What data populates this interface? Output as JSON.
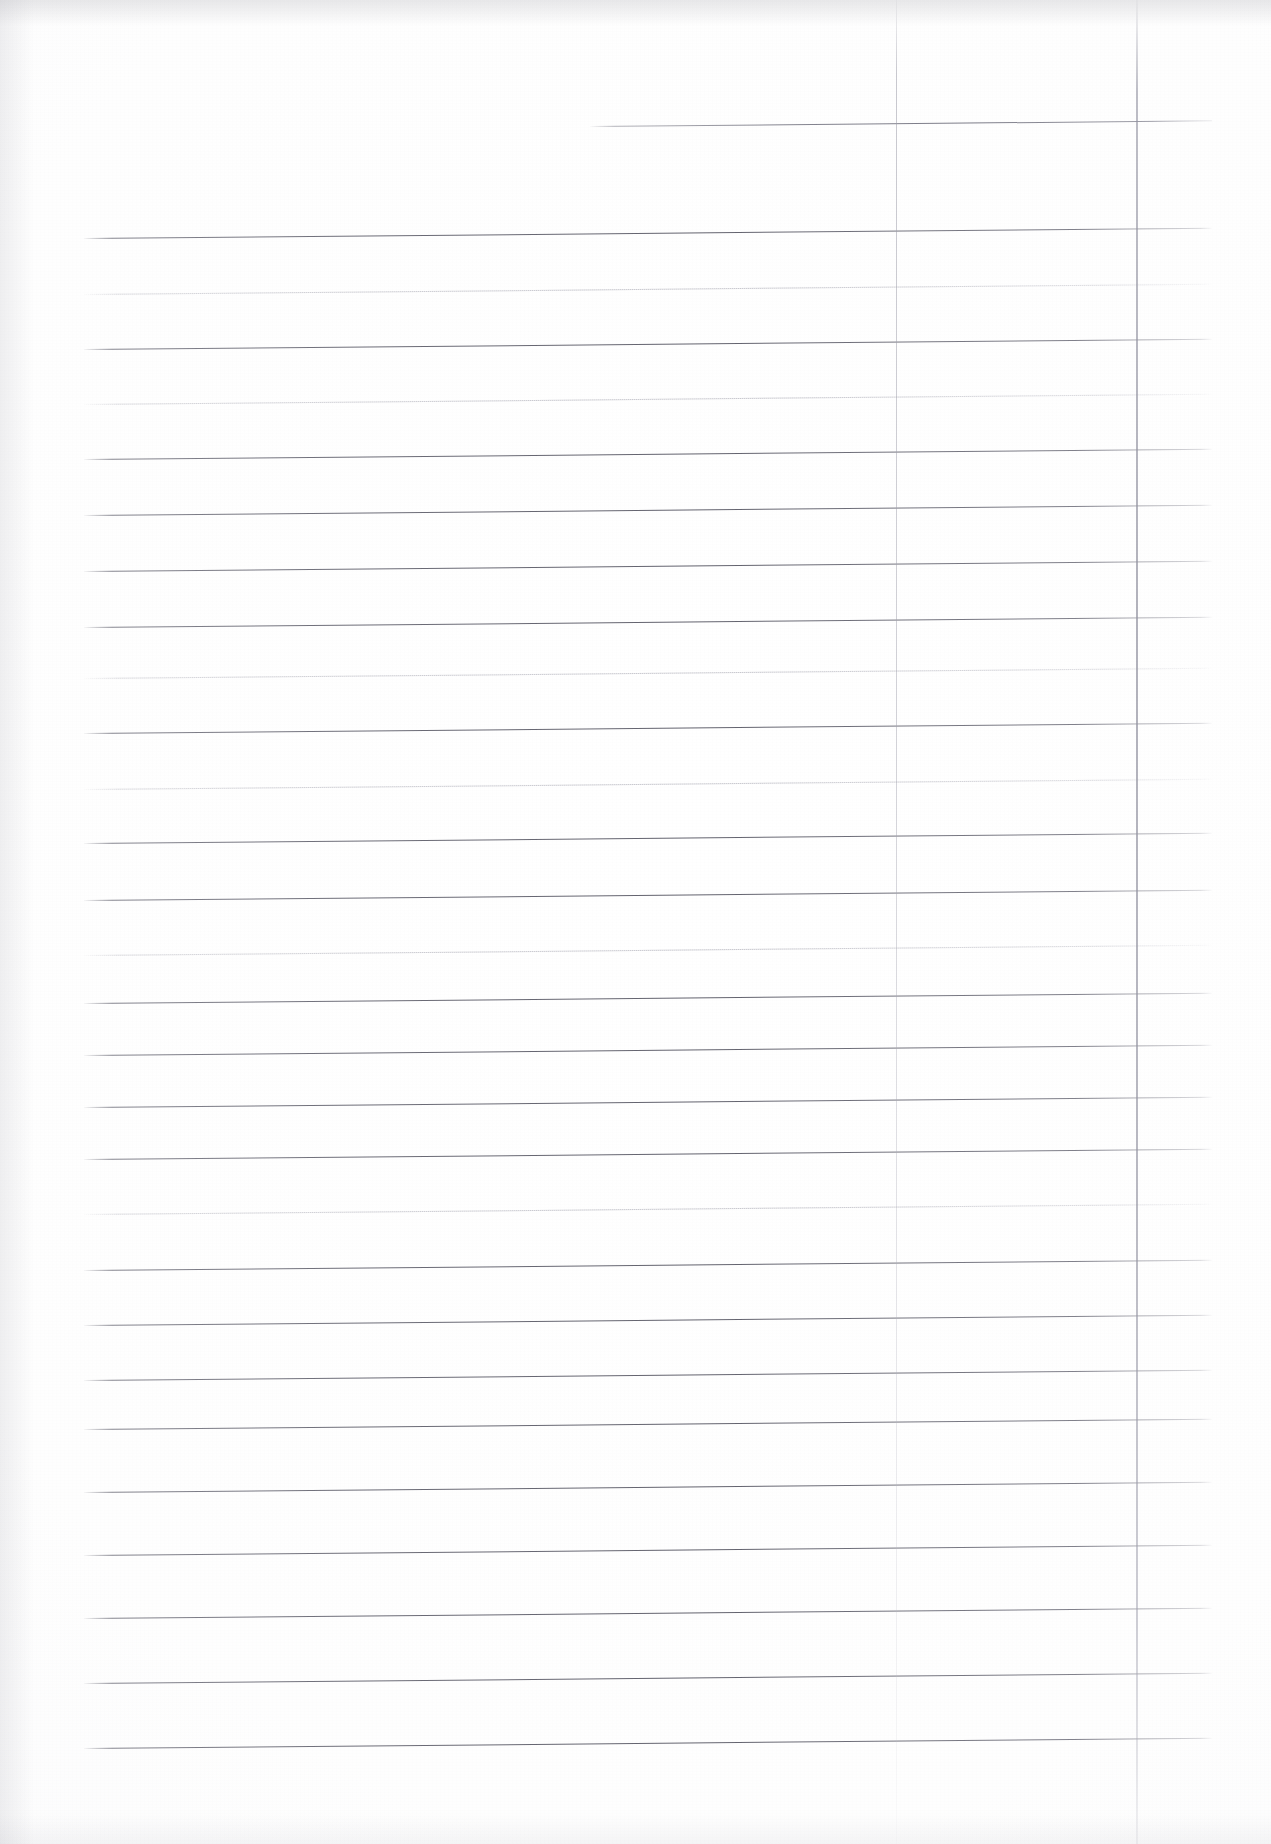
{
  "document": {
    "kind": "scanned-ruled-paper",
    "title": "Blank ruled notebook page (scan)",
    "content_text": "",
    "page_width": 1271,
    "page_height": 1844,
    "background_color": "#fefefe",
    "rule_color_dark": "#5f5f6a",
    "rule_color_light": "#9a9aa6",
    "vertical_rule_color": "#a4a4b0",
    "skew_degrees": -0.52
  },
  "ruling": {
    "line_start_x": 84,
    "line_end_x": 1212,
    "fragment_line_start_x": 590,
    "lines": [
      {
        "y": 126,
        "weight": "fragment",
        "x_start": 590,
        "x_end": 1212
      },
      {
        "y": 238,
        "weight": "dark",
        "x_start": 84,
        "x_end": 1212
      },
      {
        "y": 294,
        "weight": "light",
        "x_start": 84,
        "x_end": 1212
      },
      {
        "y": 349,
        "weight": "dark",
        "x_start": 84,
        "x_end": 1212
      },
      {
        "y": 404,
        "weight": "light",
        "x_start": 84,
        "x_end": 1212
      },
      {
        "y": 459,
        "weight": "dark",
        "x_start": 84,
        "x_end": 1212
      },
      {
        "y": 515,
        "weight": "dark",
        "x_start": 84,
        "x_end": 1212
      },
      {
        "y": 571,
        "weight": "dark",
        "x_start": 84,
        "x_end": 1212
      },
      {
        "y": 627,
        "weight": "dark",
        "x_start": 84,
        "x_end": 1212
      },
      {
        "y": 678,
        "weight": "light",
        "x_start": 84,
        "x_end": 1212
      },
      {
        "y": 733,
        "weight": "dark",
        "x_start": 84,
        "x_end": 1212
      },
      {
        "y": 789,
        "weight": "light",
        "x_start": 84,
        "x_end": 1212
      },
      {
        "y": 843,
        "weight": "dark",
        "x_start": 84,
        "x_end": 1212
      },
      {
        "y": 900,
        "weight": "dark",
        "x_start": 84,
        "x_end": 1212
      },
      {
        "y": 955,
        "weight": "light",
        "x_start": 84,
        "x_end": 1212
      },
      {
        "y": 1003,
        "weight": "dark",
        "x_start": 84,
        "x_end": 1212
      },
      {
        "y": 1055,
        "weight": "dark",
        "x_start": 84,
        "x_end": 1212
      },
      {
        "y": 1107,
        "weight": "dark",
        "x_start": 84,
        "x_end": 1212
      },
      {
        "y": 1159,
        "weight": "dark",
        "x_start": 84,
        "x_end": 1212
      },
      {
        "y": 1214,
        "weight": "light",
        "x_start": 84,
        "x_end": 1212
      },
      {
        "y": 1270,
        "weight": "dark",
        "x_start": 84,
        "x_end": 1212
      },
      {
        "y": 1325,
        "weight": "dark",
        "x_start": 84,
        "x_end": 1212
      },
      {
        "y": 1380,
        "weight": "dark",
        "x_start": 84,
        "x_end": 1212
      },
      {
        "y": 1429,
        "weight": "dark",
        "x_start": 84,
        "x_end": 1212
      },
      {
        "y": 1492,
        "weight": "dark",
        "x_start": 84,
        "x_end": 1212
      },
      {
        "y": 1555,
        "weight": "dark",
        "x_start": 84,
        "x_end": 1212
      },
      {
        "y": 1618,
        "weight": "dark",
        "x_start": 84,
        "x_end": 1212
      },
      {
        "y": 1683,
        "weight": "dark",
        "x_start": 84,
        "x_end": 1212
      },
      {
        "y": 1748,
        "weight": "dark",
        "x_start": 84,
        "x_end": 1212
      }
    ],
    "vertical_lines": [
      {
        "x": 896,
        "weight": "faint"
      },
      {
        "x": 1136,
        "weight": "faint"
      }
    ]
  }
}
